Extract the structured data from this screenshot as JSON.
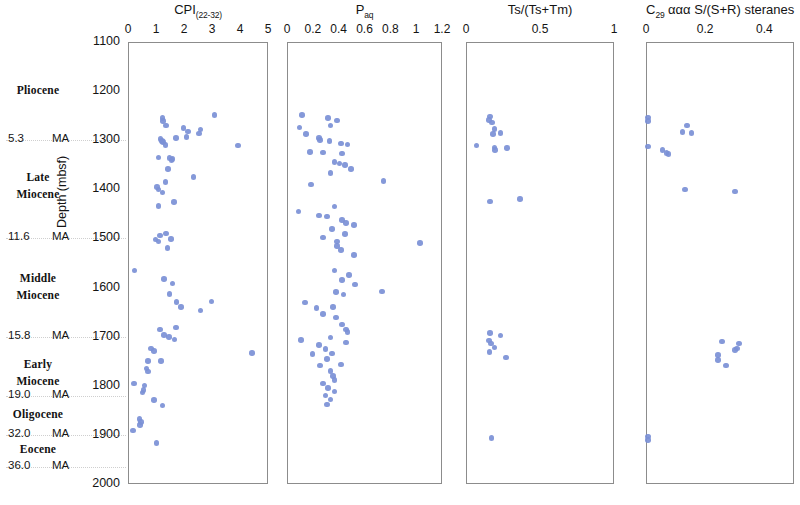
{
  "figure": {
    "depth_axis": {
      "title": "Depth (mbsf)",
      "ticks": [
        1100,
        1200,
        1300,
        1400,
        1500,
        1600,
        1700,
        1800,
        1900,
        2000
      ],
      "min": 1100,
      "max": 2000
    },
    "stratigraphy": {
      "epochs": [
        {
          "name": "Pliocene",
          "lines": [
            "Pliocene"
          ],
          "depth_center": 1200
        },
        {
          "name": "Late Miocene",
          "lines": [
            "Late",
            "Miocene"
          ],
          "depth_center": 1395
        },
        {
          "name": "Middle Miocene",
          "lines": [
            "Middle",
            "Miocene"
          ],
          "depth_center": 1600
        },
        {
          "name": "Early Miocene",
          "lines": [
            "Early",
            "Miocene"
          ],
          "depth_center": 1775
        },
        {
          "name": "Oligocene",
          "lines": [
            "Oligocene"
          ],
          "depth_center": 1860
        },
        {
          "name": "Eocene",
          "lines": [
            "Eocene"
          ],
          "depth_center": 1930
        }
      ],
      "boundaries": [
        {
          "age": "5.3",
          "unit": "MA",
          "depth": 1300
        },
        {
          "age": "11.6",
          "unit": "MA",
          "depth": 1500
        },
        {
          "age": "15.8",
          "unit": "MA",
          "depth": 1700
        },
        {
          "age": "19.0",
          "unit": "MA",
          "depth": 1820
        },
        {
          "age": "32.0",
          "unit": "MA",
          "depth": 1900
        },
        {
          "age": "36.0",
          "unit": "MA",
          "depth": 1965
        }
      ]
    },
    "marker_color": "#7b90d6",
    "axis_color": "#8c8c8c"
  },
  "chart_data": [
    {
      "type": "scatter",
      "title": "CPI (22-32)",
      "title_main": "CPI",
      "title_sub": "(22-32)",
      "xlabel": "CPI (22-32)",
      "ylabel": "Depth (mbsf)",
      "xlim": [
        0,
        5
      ],
      "ylim": [
        2000,
        1100
      ],
      "xticks": [
        0,
        1,
        2,
        3,
        4,
        5
      ],
      "grid": false,
      "points": [
        {
          "x": 3.05,
          "y": 1247
        },
        {
          "x": 1.2,
          "y": 1253
        },
        {
          "x": 1.22,
          "y": 1259
        },
        {
          "x": 1.33,
          "y": 1268
        },
        {
          "x": 1.95,
          "y": 1273
        },
        {
          "x": 2.55,
          "y": 1276
        },
        {
          "x": 2.1,
          "y": 1280
        },
        {
          "x": 2.05,
          "y": 1291
        },
        {
          "x": 2.5,
          "y": 1284
        },
        {
          "x": 1.68,
          "y": 1293
        },
        {
          "x": 1.12,
          "y": 1296
        },
        {
          "x": 1.18,
          "y": 1300
        },
        {
          "x": 1.22,
          "y": 1302
        },
        {
          "x": 3.9,
          "y": 1309
        },
        {
          "x": 1.3,
          "y": 1308
        },
        {
          "x": 1.05,
          "y": 1333
        },
        {
          "x": 1.45,
          "y": 1334
        },
        {
          "x": 1.55,
          "y": 1336
        },
        {
          "x": 1.52,
          "y": 1338
        },
        {
          "x": 1.4,
          "y": 1356
        },
        {
          "x": 2.3,
          "y": 1373
        },
        {
          "x": 1.3,
          "y": 1383
        },
        {
          "x": 1.0,
          "y": 1393
        },
        {
          "x": 1.05,
          "y": 1398
        },
        {
          "x": 1.2,
          "y": 1404
        },
        {
          "x": 1.05,
          "y": 1432
        },
        {
          "x": 1.6,
          "y": 1424
        },
        {
          "x": 1.1,
          "y": 1492
        },
        {
          "x": 1.32,
          "y": 1488
        },
        {
          "x": 0.95,
          "y": 1500
        },
        {
          "x": 1.05,
          "y": 1504
        },
        {
          "x": 1.5,
          "y": 1499
        },
        {
          "x": 1.38,
          "y": 1518
        },
        {
          "x": 0.2,
          "y": 1563
        },
        {
          "x": 1.25,
          "y": 1581
        },
        {
          "x": 1.55,
          "y": 1590
        },
        {
          "x": 1.45,
          "y": 1611
        },
        {
          "x": 1.7,
          "y": 1627
        },
        {
          "x": 1.85,
          "y": 1638
        },
        {
          "x": 2.95,
          "y": 1626
        },
        {
          "x": 2.55,
          "y": 1645
        },
        {
          "x": 1.1,
          "y": 1683
        },
        {
          "x": 1.68,
          "y": 1679
        },
        {
          "x": 1.25,
          "y": 1694
        },
        {
          "x": 1.42,
          "y": 1699
        },
        {
          "x": 1.62,
          "y": 1704
        },
        {
          "x": 0.78,
          "y": 1722
        },
        {
          "x": 0.9,
          "y": 1727
        },
        {
          "x": 4.4,
          "y": 1731
        },
        {
          "x": 0.68,
          "y": 1747
        },
        {
          "x": 1.15,
          "y": 1748
        },
        {
          "x": 0.62,
          "y": 1763
        },
        {
          "x": 0.68,
          "y": 1769
        },
        {
          "x": 0.18,
          "y": 1793
        },
        {
          "x": 0.55,
          "y": 1797
        },
        {
          "x": 0.52,
          "y": 1806
        },
        {
          "x": 0.48,
          "y": 1812
        },
        {
          "x": 0.9,
          "y": 1827
        },
        {
          "x": 1.2,
          "y": 1838
        },
        {
          "x": 0.38,
          "y": 1866
        },
        {
          "x": 0.42,
          "y": 1872
        },
        {
          "x": 0.4,
          "y": 1878
        },
        {
          "x": 0.15,
          "y": 1889
        },
        {
          "x": 0.98,
          "y": 1914
        }
      ]
    },
    {
      "type": "scatter",
      "title": "P aq",
      "title_main": "P",
      "title_sub": "aq",
      "xlabel": "P aq",
      "ylabel": "Depth (mbsf)",
      "xlim": [
        0,
        1.2
      ],
      "ylim": [
        2000,
        1100
      ],
      "xticks": [
        0,
        0.2,
        0.4,
        0.6,
        0.8,
        1.0,
        1.2
      ],
      "grid": false,
      "points": [
        {
          "x": 0.11,
          "y": 1247
        },
        {
          "x": 0.31,
          "y": 1253
        },
        {
          "x": 0.38,
          "y": 1258
        },
        {
          "x": 0.33,
          "y": 1268
        },
        {
          "x": 0.09,
          "y": 1272
        },
        {
          "x": 0.14,
          "y": 1285
        },
        {
          "x": 0.24,
          "y": 1293
        },
        {
          "x": 0.25,
          "y": 1297
        },
        {
          "x": 0.32,
          "y": 1300
        },
        {
          "x": 0.41,
          "y": 1305
        },
        {
          "x": 0.46,
          "y": 1307
        },
        {
          "x": 0.17,
          "y": 1322
        },
        {
          "x": 0.27,
          "y": 1323
        },
        {
          "x": 0.42,
          "y": 1325
        },
        {
          "x": 0.36,
          "y": 1342
        },
        {
          "x": 0.4,
          "y": 1345
        },
        {
          "x": 0.44,
          "y": 1348
        },
        {
          "x": 0.49,
          "y": 1356
        },
        {
          "x": 0.33,
          "y": 1365
        },
        {
          "x": 0.74,
          "y": 1381
        },
        {
          "x": 0.18,
          "y": 1388
        },
        {
          "x": 0.36,
          "y": 1433
        },
        {
          "x": 0.08,
          "y": 1443
        },
        {
          "x": 0.24,
          "y": 1451
        },
        {
          "x": 0.3,
          "y": 1453
        },
        {
          "x": 0.42,
          "y": 1460
        },
        {
          "x": 0.45,
          "y": 1466
        },
        {
          "x": 0.51,
          "y": 1471
        },
        {
          "x": 0.34,
          "y": 1479
        },
        {
          "x": 0.44,
          "y": 1489
        },
        {
          "x": 0.27,
          "y": 1496
        },
        {
          "x": 0.38,
          "y": 1504
        },
        {
          "x": 0.38,
          "y": 1513
        },
        {
          "x": 0.41,
          "y": 1521
        },
        {
          "x": 1.02,
          "y": 1507
        },
        {
          "x": 0.51,
          "y": 1532
        },
        {
          "x": 0.36,
          "y": 1563
        },
        {
          "x": 0.47,
          "y": 1573
        },
        {
          "x": 0.42,
          "y": 1582
        },
        {
          "x": 0.52,
          "y": 1592
        },
        {
          "x": 0.37,
          "y": 1607
        },
        {
          "x": 0.43,
          "y": 1612
        },
        {
          "x": 0.73,
          "y": 1606
        },
        {
          "x": 0.13,
          "y": 1628
        },
        {
          "x": 0.22,
          "y": 1639
        },
        {
          "x": 0.35,
          "y": 1637
        },
        {
          "x": 0.27,
          "y": 1652
        },
        {
          "x": 0.37,
          "y": 1659
        },
        {
          "x": 0.42,
          "y": 1673
        },
        {
          "x": 0.45,
          "y": 1683
        },
        {
          "x": 0.46,
          "y": 1688
        },
        {
          "x": 0.33,
          "y": 1700
        },
        {
          "x": 0.1,
          "y": 1705
        },
        {
          "x": 0.24,
          "y": 1715
        },
        {
          "x": 0.29,
          "y": 1723
        },
        {
          "x": 0.45,
          "y": 1710
        },
        {
          "x": 0.19,
          "y": 1733
        },
        {
          "x": 0.34,
          "y": 1732
        },
        {
          "x": 0.3,
          "y": 1744
        },
        {
          "x": 0.25,
          "y": 1757
        },
        {
          "x": 0.41,
          "y": 1755
        },
        {
          "x": 0.33,
          "y": 1768
        },
        {
          "x": 0.35,
          "y": 1778
        },
        {
          "x": 0.36,
          "y": 1786
        },
        {
          "x": 0.27,
          "y": 1793
        },
        {
          "x": 0.31,
          "y": 1802
        },
        {
          "x": 0.36,
          "y": 1810
        },
        {
          "x": 0.29,
          "y": 1818
        },
        {
          "x": 0.33,
          "y": 1826
        },
        {
          "x": 0.3,
          "y": 1836
        }
      ]
    },
    {
      "type": "scatter",
      "title": "Ts/(Ts+Tm)",
      "title_main": "Ts/(Ts+Tm)",
      "title_sub": "",
      "xlabel": "Ts/(Ts+Tm)",
      "ylabel": "Depth (mbsf)",
      "xlim": [
        0,
        1.0
      ],
      "ylim": [
        2000,
        1100
      ],
      "xticks": [
        0,
        0.5,
        1.0
      ],
      "grid": false,
      "points": [
        {
          "x": 0.155,
          "y": 1250
        },
        {
          "x": 0.15,
          "y": 1257
        },
        {
          "x": 0.17,
          "y": 1262
        },
        {
          "x": 0.185,
          "y": 1275
        },
        {
          "x": 0.175,
          "y": 1285
        },
        {
          "x": 0.225,
          "y": 1283
        },
        {
          "x": 0.065,
          "y": 1309
        },
        {
          "x": 0.185,
          "y": 1313
        },
        {
          "x": 0.19,
          "y": 1318
        },
        {
          "x": 0.27,
          "y": 1314
        },
        {
          "x": 0.155,
          "y": 1423
        },
        {
          "x": 0.36,
          "y": 1418
        },
        {
          "x": 0.155,
          "y": 1690
        },
        {
          "x": 0.225,
          "y": 1696
        },
        {
          "x": 0.148,
          "y": 1706
        },
        {
          "x": 0.162,
          "y": 1712
        },
        {
          "x": 0.185,
          "y": 1720
        },
        {
          "x": 0.152,
          "y": 1729
        },
        {
          "x": 0.265,
          "y": 1740
        },
        {
          "x": 0.165,
          "y": 1904
        }
      ]
    },
    {
      "type": "scatter",
      "title": "C29 aaa S/(S+R) steranes",
      "title_main": "C",
      "title_sub": "29",
      "title_rest": " ααα S/(S+R) steranes",
      "xlabel": "C29 ααα S/(S+R) steranes",
      "ylabel": "Depth (mbsf)",
      "xlim": [
        0,
        0.5
      ],
      "ylim": [
        2000,
        1100
      ],
      "xticks": [
        0,
        0.2,
        0.4
      ],
      "grid": false,
      "points": [
        {
          "x": 0.004,
          "y": 1252
        },
        {
          "x": 0.004,
          "y": 1259
        },
        {
          "x": 0.135,
          "y": 1268
        },
        {
          "x": 0.12,
          "y": 1281
        },
        {
          "x": 0.15,
          "y": 1283
        },
        {
          "x": 0.004,
          "y": 1311
        },
        {
          "x": 0.053,
          "y": 1318
        },
        {
          "x": 0.066,
          "y": 1324
        },
        {
          "x": 0.072,
          "y": 1326
        },
        {
          "x": 0.128,
          "y": 1398
        },
        {
          "x": 0.298,
          "y": 1402
        },
        {
          "x": 0.253,
          "y": 1708
        },
        {
          "x": 0.31,
          "y": 1712
        },
        {
          "x": 0.298,
          "y": 1725
        },
        {
          "x": 0.305,
          "y": 1722
        },
        {
          "x": 0.24,
          "y": 1735
        },
        {
          "x": 0.24,
          "y": 1746
        },
        {
          "x": 0.266,
          "y": 1757
        },
        {
          "x": 0.004,
          "y": 1901
        },
        {
          "x": 0.004,
          "y": 1908
        }
      ]
    }
  ]
}
